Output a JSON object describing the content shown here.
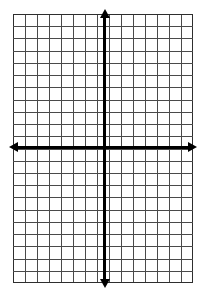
{
  "page": {
    "background_color": "#ffffff",
    "width": 207,
    "height": 297
  },
  "grid": {
    "name": "coordinate-grid",
    "columns": 15,
    "rows": 22,
    "cell_size_px": 12,
    "left_px": 13,
    "top_px": 14,
    "width_px": 180,
    "height_px": 269,
    "gridline_color": "#4a4a4a",
    "border_color": "#2e2e2e",
    "fill_color": "#ffffff",
    "labels_shown": false,
    "tick_labels": []
  },
  "axes": {
    "x_axis": {
      "name": "x-axis",
      "color": "#000000",
      "thickness_px": 3,
      "y_position_px": 147,
      "start_px": 12,
      "end_px": 195,
      "arrow_start": true,
      "arrow_end": true,
      "label": ""
    },
    "y_axis": {
      "name": "y-axis",
      "color": "#000000",
      "thickness_px": 3,
      "x_position_px": 104,
      "start_px": 11,
      "end_px": 288,
      "arrow_start": true,
      "arrow_end": true,
      "label": ""
    },
    "origin": {
      "x_px": 104,
      "y_px": 147,
      "label": ""
    }
  },
  "chart_data": {
    "type": "scatter",
    "title": "",
    "subtitle": "",
    "xlabel": "",
    "ylabel": "",
    "xlim": [
      -7.5,
      7.5
    ],
    "ylim": [
      -11,
      11
    ],
    "xticks": [],
    "yticks": [],
    "grid": true,
    "grid_spacing": 1,
    "legend": false,
    "legend_position": "none",
    "annotations": [],
    "series": [
      {
        "name": "empty",
        "x": [],
        "y": []
      }
    ]
  },
  "icons": {
    "arrow_left": "arrow-left-icon",
    "arrow_right": "arrow-right-icon",
    "arrow_up": "arrow-up-icon",
    "arrow_down": "arrow-down-icon"
  }
}
